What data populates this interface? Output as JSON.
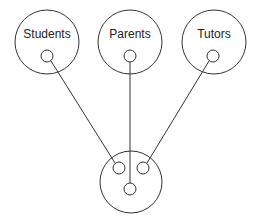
{
  "diagram": {
    "type": "connection-diagram",
    "stroke_color": "#333333",
    "background": "#ffffff",
    "nodes": [
      {
        "id": "students",
        "label": "Students",
        "cx": 47,
        "cy": 42,
        "r": 32,
        "port": {
          "cx": 47,
          "cy": 56,
          "r": 6
        }
      },
      {
        "id": "parents",
        "label": "Parents",
        "cx": 130,
        "cy": 42,
        "r": 32,
        "port": {
          "cx": 130,
          "cy": 56,
          "r": 6
        }
      },
      {
        "id": "tutors",
        "label": "Tutors",
        "cx": 214,
        "cy": 42,
        "r": 32,
        "port": {
          "cx": 213,
          "cy": 56,
          "r": 6
        }
      }
    ],
    "hub": {
      "id": "hub",
      "label": "",
      "cx": 131,
      "cy": 182,
      "r": 31,
      "ports": [
        {
          "id": "hub-left",
          "cx": 119,
          "cy": 168,
          "r": 6
        },
        {
          "id": "hub-right",
          "cx": 143,
          "cy": 168,
          "r": 6
        },
        {
          "id": "hub-bottom",
          "cx": 130,
          "cy": 189,
          "r": 6
        }
      ]
    },
    "edges": [
      {
        "from": "students",
        "to": "hub-left"
      },
      {
        "from": "parents",
        "to": "hub-bottom"
      },
      {
        "from": "tutors",
        "to": "hub-right"
      }
    ]
  }
}
